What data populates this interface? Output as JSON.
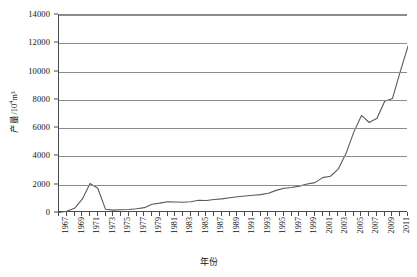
{
  "chart_data": {
    "type": "line",
    "title": "",
    "xlabel": "年份",
    "ylabel": "产量/10⁴m³",
    "ylabel_base": "产量/10",
    "ylabel_sup": "4",
    "ylabel_unit": "m³",
    "ylim": [
      0,
      14000
    ],
    "ytick_labels": [
      "0",
      "2000",
      "4000",
      "6000",
      "8000",
      "10000",
      "12000",
      "14000"
    ],
    "ytick_values": [
      0,
      2000,
      4000,
      6000,
      8000,
      10000,
      12000,
      14000
    ],
    "xlim": [
      1967,
      2012
    ],
    "xtick_labels": [
      "1967",
      "1969",
      "1971",
      "1973",
      "1975",
      "1977",
      "1979",
      "1981",
      "1983",
      "1985",
      "1987",
      "1989",
      "1991",
      "1993",
      "1995",
      "1997",
      "1999",
      "2001",
      "2003",
      "2005",
      "2007",
      "2009",
      "2011"
    ],
    "grid": "horizontal",
    "legend": "none",
    "line_color": "#595959",
    "x": [
      1967,
      1968,
      1969,
      1970,
      1971,
      1972,
      1973,
      1974,
      1975,
      1976,
      1977,
      1978,
      1979,
      1980,
      1981,
      1982,
      1983,
      1984,
      1985,
      1986,
      1987,
      1988,
      1989,
      1990,
      1991,
      1992,
      1993,
      1994,
      1995,
      1996,
      1997,
      1998,
      1999,
      2000,
      2001,
      2002,
      2003,
      2004,
      2005,
      2006,
      2007,
      2008,
      2009,
      2010,
      2011,
      2012
    ],
    "values": [
      40,
      120,
      330,
      980,
      2080,
      1750,
      260,
      200,
      230,
      250,
      300,
      380,
      620,
      700,
      800,
      780,
      760,
      800,
      900,
      880,
      950,
      1000,
      1080,
      1150,
      1200,
      1250,
      1300,
      1400,
      1600,
      1750,
      1800,
      1900,
      2050,
      2150,
      2500,
      2600,
      3100,
      4200,
      5700,
      6900,
      6400,
      6700,
      7900,
      8100,
      10000,
      11800
    ]
  }
}
